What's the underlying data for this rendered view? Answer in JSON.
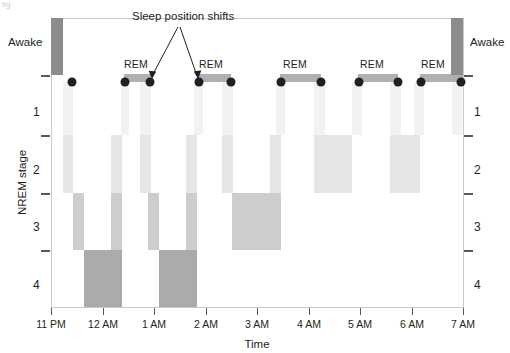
{
  "figure": {
    "axis_titles": {
      "x": "Time",
      "y": "NREM stage"
    },
    "left_awake_label": "Awake",
    "right_awake_label": "Awake",
    "annotation": "Sleep position shifts",
    "rem_label": "REM",
    "corner_artifact": "fig"
  },
  "chart_data": {
    "type": "area",
    "title": "",
    "xlabel": "Time",
    "ylabel": "NREM stage",
    "xlim": [
      "11 PM",
      "7 AM"
    ],
    "ylim": [
      "Awake",
      "4"
    ],
    "grid": false,
    "legend": null,
    "x_tick_labels": [
      "11 PM",
      "12 AM",
      "1 AM",
      "2 AM",
      "3 AM",
      "4 AM",
      "5 AM",
      "6 AM",
      "7 AM"
    ],
    "x_tick_hours": [
      23,
      0,
      1,
      2,
      3,
      4,
      5,
      6,
      7
    ],
    "y_tick_labels": [
      "Awake",
      "1",
      "2",
      "3",
      "4"
    ],
    "y_levels": [
      "Awake",
      "REM",
      "1",
      "2",
      "3",
      "4"
    ],
    "stage_colors": {
      "awake": "#8c8c8c",
      "rem": "#b0b0b0",
      "stage1": "#f0f0f0",
      "stage2": "#e2e2e2",
      "stage3": "#c8c8c8",
      "stage4": "#a8a8a8"
    },
    "position_shift_marker": "dot",
    "position_shift_times": [
      "11:15 PM",
      "12:05 AM",
      "12:30 AM",
      "1:15 AM",
      "1:45 AM",
      "2:45 AM",
      "3:25 AM",
      "4:35 AM",
      "5:15 AM",
      "5:35 AM",
      "6:20 AM"
    ],
    "rem_periods": [
      {
        "start": "12:05 AM",
        "end": "12:30 AM"
      },
      {
        "start": "1:15 AM",
        "end": "1:45 AM"
      },
      {
        "start": "2:45 AM",
        "end": "3:25 AM"
      },
      {
        "start": "4:35 AM",
        "end": "5:15 AM"
      },
      {
        "start": "5:35 AM",
        "end": "6:20 AM"
      }
    ],
    "awake_periods": [
      {
        "start": "11:00 PM",
        "end": "11:10 PM"
      },
      {
        "start": "6:20 AM",
        "end": "7:00 AM"
      }
    ],
    "annotated_shift_times": [
      "12:30 AM",
      "1:15 AM"
    ],
    "hypnogram_segments": [
      {
        "stage": "Awake",
        "start": "11:00 PM",
        "end": "11:10 PM"
      },
      {
        "stage": "1",
        "start": "11:10 PM",
        "end": "11:25 PM"
      },
      {
        "stage": "2",
        "start": "11:25 PM",
        "end": "11:45 PM"
      },
      {
        "stage": "3",
        "start": "11:45 PM",
        "end": "12:05 AM"
      },
      {
        "stage": "4",
        "start": "12:05 AM",
        "end": "12:45 AM"
      },
      {
        "stage": "3",
        "start": "12:45 AM",
        "end": "1:00 AM"
      },
      {
        "stage": "2",
        "start": "1:00 AM",
        "end": "1:10 AM"
      },
      {
        "stage": "1",
        "start": "1:10 AM",
        "end": "1:15 AM"
      },
      {
        "stage": "REM",
        "start": "1:15 AM",
        "end": "1:45 AM"
      },
      {
        "stage": "1",
        "start": "1:45 AM",
        "end": "1:55 AM"
      },
      {
        "stage": "2",
        "start": "1:55 AM",
        "end": "2:05 AM"
      },
      {
        "stage": "3",
        "start": "2:05 AM",
        "end": "2:20 AM"
      },
      {
        "stage": "4",
        "start": "2:20 AM",
        "end": "2:45 AM"
      },
      {
        "stage": "3",
        "start": "2:45 AM",
        "end": "3:00 AM"
      },
      {
        "stage": "2",
        "start": "3:00 AM",
        "end": "3:15 AM"
      },
      {
        "stage": "1",
        "start": "3:15 AM",
        "end": "3:25 AM"
      },
      {
        "stage": "REM",
        "start": "3:25 AM",
        "end": "4:05 AM"
      },
      {
        "stage": "2",
        "start": "4:05 AM",
        "end": "4:35 AM"
      },
      {
        "stage": "REM",
        "start": "4:35 AM",
        "end": "5:15 AM"
      },
      {
        "stage": "2",
        "start": "5:15 AM",
        "end": "5:35 AM"
      },
      {
        "stage": "REM",
        "start": "5:35 AM",
        "end": "6:20 AM"
      },
      {
        "stage": "Awake",
        "start": "6:20 AM",
        "end": "7:00 AM"
      }
    ]
  },
  "marks": {
    "awake_bars": [
      {
        "x": 51,
        "y": 18,
        "w": 12,
        "h": 57,
        "color": "#8c8c8c"
      },
      {
        "x": 451,
        "y": 18,
        "w": 12,
        "h": 57,
        "color": "#8c8c8c"
      }
    ],
    "rem_bars": [
      {
        "x": 124,
        "y": 74,
        "w": 27,
        "h": 8,
        "color": "#b0b0b0"
      },
      {
        "x": 198,
        "y": 74,
        "w": 33,
        "h": 8,
        "color": "#b0b0b0"
      },
      {
        "x": 280,
        "y": 74,
        "w": 41,
        "h": 8,
        "color": "#b0b0b0"
      },
      {
        "x": 358,
        "y": 74,
        "w": 40,
        "h": 8,
        "color": "#b0b0b0"
      },
      {
        "x": 420,
        "y": 74,
        "w": 43,
        "h": 8,
        "color": "#b0b0b0"
      }
    ],
    "rem_labels": [
      {
        "x": 124,
        "y": 58
      },
      {
        "x": 199,
        "y": 58
      },
      {
        "x": 283,
        "y": 58
      },
      {
        "x": 360,
        "y": 58
      },
      {
        "x": 421,
        "y": 58
      }
    ],
    "dots": [
      {
        "x": 72,
        "y": 82
      },
      {
        "x": 125,
        "y": 82
      },
      {
        "x": 150,
        "y": 82
      },
      {
        "x": 199,
        "y": 82
      },
      {
        "x": 231,
        "y": 82
      },
      {
        "x": 281,
        "y": 82
      },
      {
        "x": 321,
        "y": 82
      },
      {
        "x": 359,
        "y": 82
      },
      {
        "x": 398,
        "y": 82
      },
      {
        "x": 421,
        "y": 82
      },
      {
        "x": 461,
        "y": 82
      }
    ],
    "stage_bars": [
      {
        "x": 63,
        "y": 82,
        "w": 10,
        "h": 53,
        "color": "#f2f2f2"
      },
      {
        "x": 63,
        "y": 135,
        "w": 10,
        "h": 58,
        "color": "#e6e6e6"
      },
      {
        "x": 73,
        "y": 193,
        "w": 11,
        "h": 57,
        "color": "#cdcdcd"
      },
      {
        "x": 84,
        "y": 250,
        "w": 38,
        "h": 57,
        "color": "#ababab"
      },
      {
        "x": 111,
        "y": 193,
        "w": 11,
        "h": 57,
        "color": "#cdcdcd"
      },
      {
        "x": 111,
        "y": 135,
        "w": 11,
        "h": 58,
        "color": "#e6e6e6"
      },
      {
        "x": 121,
        "y": 82,
        "w": 8,
        "h": 53,
        "color": "#f2f2f2"
      },
      {
        "x": 140,
        "y": 82,
        "w": 11,
        "h": 53,
        "color": "#f2f2f2"
      },
      {
        "x": 140,
        "y": 135,
        "w": 11,
        "h": 58,
        "color": "#e6e6e6"
      },
      {
        "x": 148,
        "y": 193,
        "w": 11,
        "h": 57,
        "color": "#cdcdcd"
      },
      {
        "x": 159,
        "y": 250,
        "w": 38,
        "h": 57,
        "color": "#ababab"
      },
      {
        "x": 186,
        "y": 193,
        "w": 11,
        "h": 57,
        "color": "#cdcdcd"
      },
      {
        "x": 186,
        "y": 135,
        "w": 11,
        "h": 58,
        "color": "#e6e6e6"
      },
      {
        "x": 194,
        "y": 82,
        "w": 9,
        "h": 53,
        "color": "#f2f2f2"
      },
      {
        "x": 222,
        "y": 82,
        "w": 11,
        "h": 53,
        "color": "#f2f2f2"
      },
      {
        "x": 222,
        "y": 135,
        "w": 11,
        "h": 58,
        "color": "#e6e6e6"
      },
      {
        "x": 232,
        "y": 193,
        "w": 11,
        "h": 57,
        "color": "#cdcdcd"
      },
      {
        "x": 243,
        "y": 193,
        "w": 38,
        "h": 57,
        "color": "#cdcdcd"
      },
      {
        "x": 270,
        "y": 135,
        "w": 11,
        "h": 58,
        "color": "#e6e6e6"
      },
      {
        "x": 276,
        "y": 82,
        "w": 9,
        "h": 53,
        "color": "#f2f2f2"
      },
      {
        "x": 314,
        "y": 82,
        "w": 11,
        "h": 53,
        "color": "#f2f2f2"
      },
      {
        "x": 314,
        "y": 135,
        "w": 38,
        "h": 58,
        "color": "#e6e6e6"
      },
      {
        "x": 352,
        "y": 82,
        "w": 10,
        "h": 53,
        "color": "#f2f2f2"
      },
      {
        "x": 390,
        "y": 82,
        "w": 11,
        "h": 53,
        "color": "#f2f2f2"
      },
      {
        "x": 390,
        "y": 135,
        "w": 30,
        "h": 58,
        "color": "#e6e6e6"
      },
      {
        "x": 414,
        "y": 82,
        "w": 10,
        "h": 53,
        "color": "#f2f2f2"
      },
      {
        "x": 452,
        "y": 82,
        "w": 10,
        "h": 53,
        "color": "#f2f2f2"
      }
    ]
  },
  "axes": {
    "plot": {
      "left": 51,
      "top": 18,
      "right": 463,
      "bottom": 307
    },
    "y_ticks": [
      {
        "label": "Awake",
        "y": 47,
        "tick_y": 75,
        "show_tick": true
      },
      {
        "label": "1",
        "y": 105,
        "tick_y": 135,
        "show_tick": true
      },
      {
        "label": "2",
        "y": 163,
        "tick_y": 193,
        "show_tick": true
      },
      {
        "label": "3",
        "y": 220,
        "tick_y": 250,
        "show_tick": true
      },
      {
        "label": "4",
        "y": 278,
        "tick_y": 307,
        "show_tick": false
      }
    ],
    "x_ticks": [
      {
        "label": "11 PM",
        "x": 51
      },
      {
        "label": "12 AM",
        "x": 103
      },
      {
        "label": "1 AM",
        "x": 154
      },
      {
        "label": "2 AM",
        "x": 206
      },
      {
        "label": "3 AM",
        "x": 257
      },
      {
        "label": "4 AM",
        "x": 309
      },
      {
        "label": "5 AM",
        "x": 360
      },
      {
        "label": "6 AM",
        "x": 412
      },
      {
        "label": "7 AM",
        "x": 463
      }
    ]
  }
}
